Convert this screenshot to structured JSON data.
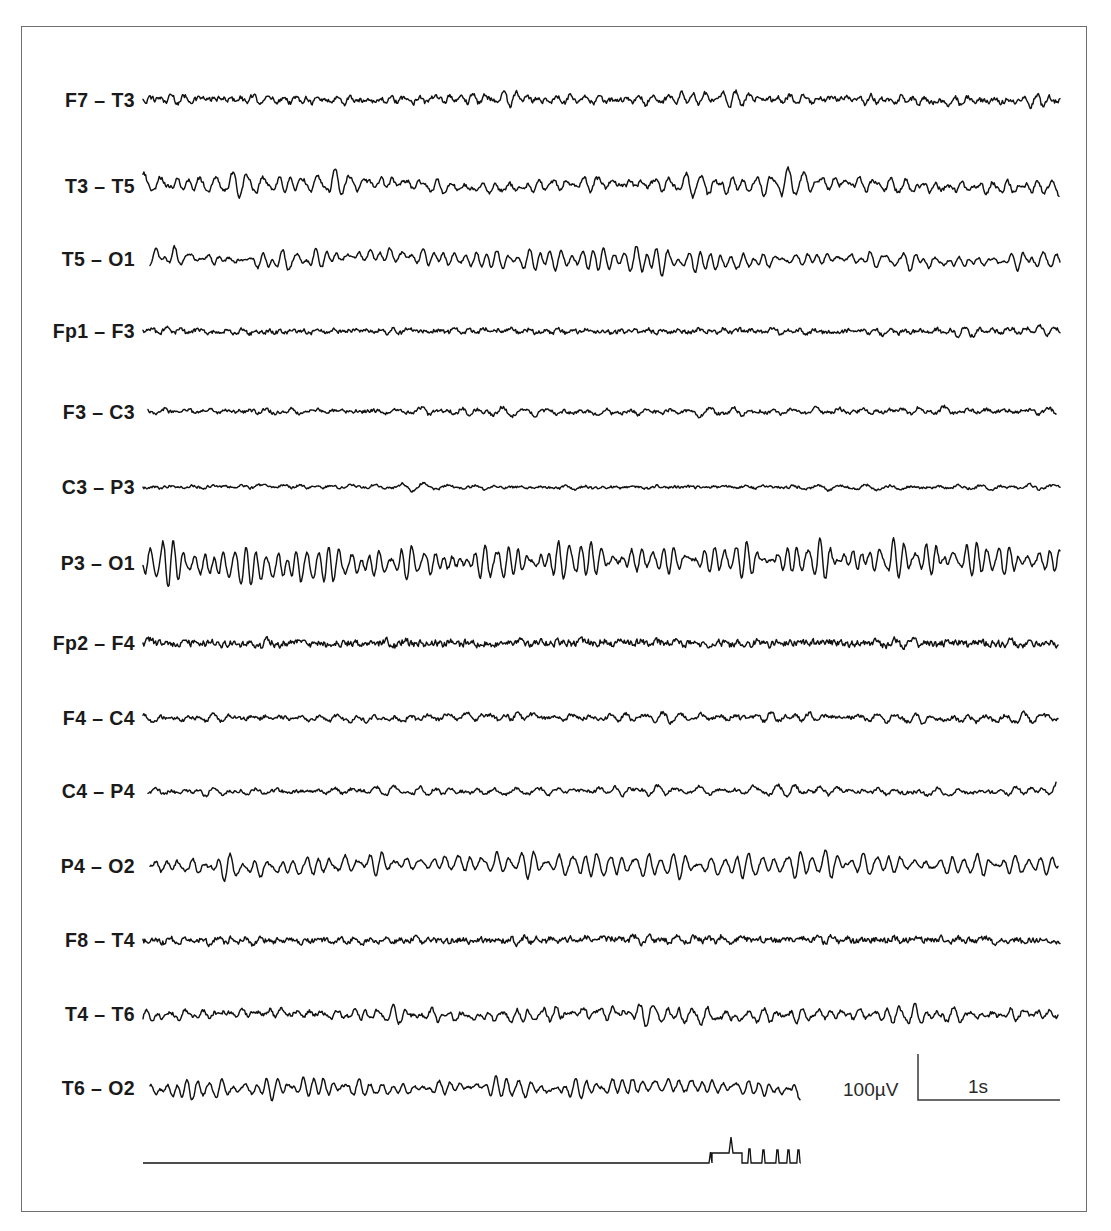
{
  "figure": {
    "background_color": "#ffffff",
    "trace_color": "#121212",
    "frame_color": "#6f6f72"
  },
  "channels": [
    {
      "label": "F7 – T3",
      "name": "f7-t3"
    },
    {
      "label": "T3 – T5",
      "name": "t3-t5"
    },
    {
      "label": "T5 – O1",
      "name": "t5-o1"
    },
    {
      "label": "Fp1 – F3",
      "name": "fp1-f3"
    },
    {
      "label": "F3 – C3",
      "name": "f3-c3"
    },
    {
      "label": "C3 – P3",
      "name": "c3-p3"
    },
    {
      "label": "P3 – O1",
      "name": "p3-o1"
    },
    {
      "label": "Fp2 – F4",
      "name": "fp2-f4"
    },
    {
      "label": "F4 – C4",
      "name": "f4-c4"
    },
    {
      "label": "C4 – P4",
      "name": "c4-p4"
    },
    {
      "label": "P4 – O2",
      "name": "p4-o2"
    },
    {
      "label": "F8 – T4",
      "name": "f8-t4"
    },
    {
      "label": "T4 – T6",
      "name": "t4-t6"
    },
    {
      "label": "T6 – O2",
      "name": "t6-o2"
    }
  ],
  "scale_bar": {
    "amplitude_label": "100µV",
    "time_label": "1s"
  },
  "chart_data": {
    "type": "line",
    "xlabel": "",
    "ylabel": "",
    "grid": false,
    "legend": "none",
    "x_range_seconds": [
      0,
      10.25
    ],
    "x_pixel_range": [
      143,
      1062
    ],
    "channel_spacing_px": 71,
    "first_channel_baseline_px": 100,
    "scale_bar": {
      "amplitude_uV": 100,
      "amplitude_label": "100µV",
      "amplitude_px": 46,
      "time_seconds": 1,
      "time_label": "1s",
      "time_px": 90,
      "corner_x_px": 918,
      "corner_y_px": 1100
    },
    "series": [
      {
        "name": "F7 – T3",
        "baseline_px": 100,
        "amplitude_uV": 34,
        "dominant_freq_hz": 9.0,
        "noise_uV": 16,
        "x_start_px": 143,
        "x_end_px": 1060,
        "character": "low-amplitude mixed frequency with superimposed fast activity"
      },
      {
        "name": "T3 – T5",
        "baseline_px": 186,
        "amplitude_uV": 62,
        "dominant_freq_hz": 8.6,
        "noise_uV": 14,
        "x_start_px": 143,
        "x_end_px": 1059,
        "character": "moderate rhythmic theta-alpha"
      },
      {
        "name": "T5 – O1",
        "baseline_px": 259,
        "amplitude_uV": 70,
        "dominant_freq_hz": 10.0,
        "noise_uV": 9,
        "x_start_px": 150,
        "x_end_px": 1060,
        "character": "well-formed posterior alpha rhythm"
      },
      {
        "name": "Fp1 – F3",
        "baseline_px": 331,
        "amplitude_uV": 20,
        "dominant_freq_hz": 7.0,
        "noise_uV": 14,
        "x_start_px": 143,
        "x_end_px": 1060,
        "character": "low-voltage irregular"
      },
      {
        "name": "F3 – C3",
        "baseline_px": 412,
        "amplitude_uV": 26,
        "dominant_freq_hz": 6.5,
        "noise_uV": 12,
        "x_start_px": 148,
        "x_end_px": 1056,
        "character": "low-voltage mixed frequency"
      },
      {
        "name": "C3 – P3",
        "baseline_px": 487,
        "amplitude_uV": 14,
        "dominant_freq_hz": 5.5,
        "noise_uV": 8,
        "x_start_px": 143,
        "x_end_px": 1060,
        "character": "very low amplitude, attenuated"
      },
      {
        "name": "P3 – O1",
        "baseline_px": 563,
        "amplitude_uV": 110,
        "dominant_freq_hz": 10.2,
        "noise_uV": 13,
        "x_start_px": 143,
        "x_end_px": 1060,
        "character": "high-amplitude posterior alpha rhythm"
      },
      {
        "name": "Fp2 – F4",
        "baseline_px": 643,
        "amplitude_uV": 16,
        "dominant_freq_hz": 6.0,
        "noise_uV": 22,
        "x_start_px": 143,
        "x_end_px": 1058,
        "character": "low-voltage with prominent fast muscle artifact"
      },
      {
        "name": "F4 – C4",
        "baseline_px": 718,
        "amplitude_uV": 30,
        "dominant_freq_hz": 6.8,
        "noise_uV": 13,
        "x_start_px": 143,
        "x_end_px": 1058,
        "character": "low-voltage mixed frequency"
      },
      {
        "name": "C4 – P4",
        "baseline_px": 791,
        "amplitude_uV": 30,
        "dominant_freq_hz": 6.2,
        "noise_uV": 11,
        "x_start_px": 148,
        "x_end_px": 1056,
        "character": "low-voltage mixed frequency with late transient"
      },
      {
        "name": "P4 – O2",
        "baseline_px": 866,
        "amplitude_uV": 62,
        "dominant_freq_hz": 9.6,
        "noise_uV": 10,
        "x_start_px": 150,
        "x_end_px": 1058,
        "character": "posterior alpha rhythm"
      },
      {
        "name": "F8 – T4",
        "baseline_px": 940,
        "amplitude_uV": 18,
        "dominant_freq_hz": 7.2,
        "noise_uV": 18,
        "x_start_px": 143,
        "x_end_px": 1060,
        "character": "low-voltage with fast activity"
      },
      {
        "name": "T4 – T6",
        "baseline_px": 1014,
        "amplitude_uV": 48,
        "dominant_freq_hz": 8.4,
        "noise_uV": 14,
        "x_start_px": 143,
        "x_end_px": 1058,
        "character": "moderate rhythmic activity"
      },
      {
        "name": "T6 – O2",
        "baseline_px": 1088,
        "amplitude_uV": 60,
        "dominant_freq_hz": 9.8,
        "noise_uV": 10,
        "x_start_px": 150,
        "x_end_px": 800,
        "character": "posterior alpha rhythm, record ends early"
      }
    ],
    "marker_channel": {
      "name": "event-marker",
      "baseline_px": 1163,
      "x_start_px": 143,
      "x_end_px": 800,
      "description": "flat baseline followed by a plateau with one tall spike, then five evenly spaced narrow spikes",
      "events": [
        {
          "type": "plateau",
          "x_px": 718,
          "width_px": 30,
          "height_px": 10
        },
        {
          "type": "spike",
          "x_px": 712,
          "height_px": 11
        },
        {
          "type": "spike",
          "x_px": 731,
          "height_px": 26
        },
        {
          "type": "spike",
          "x_px": 750,
          "height_px": 14
        },
        {
          "type": "spike",
          "x_px": 764,
          "height_px": 13
        },
        {
          "type": "spike",
          "x_px": 778,
          "height_px": 13
        },
        {
          "type": "spike",
          "x_px": 789,
          "height_px": 13
        },
        {
          "type": "spike",
          "x_px": 799,
          "height_px": 13
        }
      ]
    }
  }
}
